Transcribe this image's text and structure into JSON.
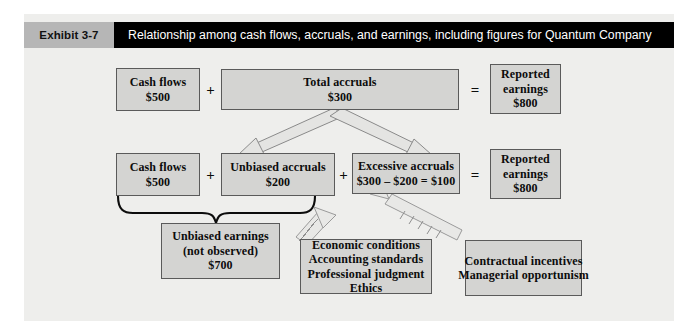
{
  "header": {
    "exhibit_label": "Exhibit 3-7",
    "title": "Relationship among cash flows, accruals, and earnings, including figures for Quantum Company"
  },
  "colors": {
    "panel_bg": "#eeeeec",
    "box_fill": "#d4d4d2",
    "box_border": "#5a5a5a",
    "header_band": "#000000",
    "header_tab": "#b6b6b6",
    "header_text": "#ffffff",
    "text": "#0c0c0c"
  },
  "row1": {
    "cash_flows": {
      "line1": "Cash flows",
      "line2": "$500"
    },
    "op_plus": "+",
    "total_accruals": {
      "line1": "Total accruals",
      "line2": "$300"
    },
    "op_equals": "=",
    "reported_earnings": {
      "line1": "Reported",
      "line2": "earnings",
      "line3": "$800"
    }
  },
  "row2": {
    "cash_flows": {
      "line1": "Cash flows",
      "line2": "$500"
    },
    "op_plus_1": "+",
    "unbiased_accruals": {
      "line1": "Unbiased accruals",
      "line2": "$200"
    },
    "op_plus_2": "+",
    "excessive_accruals": {
      "line1": "Excessive accruals",
      "line2": "$300 – $200 = $100"
    },
    "op_equals": "=",
    "reported_earnings": {
      "line1": "Reported",
      "line2": "earnings",
      "line3": "$800"
    }
  },
  "unbiased_earnings": {
    "line1": "Unbiased earnings",
    "line2": "(not observed)",
    "line3": "$700"
  },
  "drivers": {
    "unbiased_factors": {
      "line1": "Economic conditions",
      "line2": "Accounting standards",
      "line3": "Professional judgment",
      "line4": "Ethics"
    },
    "excessive_factors": {
      "line1": "Contractual incentives",
      "line2": "Managerial opportunism"
    }
  },
  "connectors": {
    "split_arrow_left": "arrow-down-left-icon",
    "split_arrow_right": "arrow-down-right-icon",
    "brace": "curly-brace-icon",
    "dashed_arrow_unbiased": "dashed-arrow-up-icon",
    "dashed_arrow_excessive": "dashed-arrow-up-icon"
  }
}
